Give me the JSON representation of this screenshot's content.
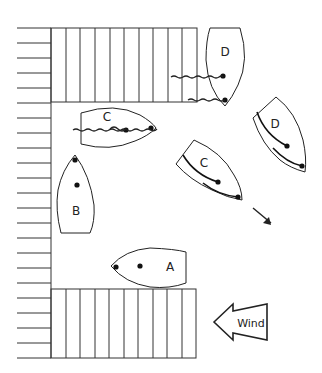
{
  "diagram": {
    "type": "boat-docking-maneuver",
    "boats": [
      {
        "id": "A",
        "label": "A",
        "position": "approaching lower dock, bow pointing left"
      },
      {
        "id": "B",
        "label": "B",
        "position": "alongside left wall, bow pointing up"
      },
      {
        "id": "C-moored",
        "label": "C",
        "position": "moored under upper dock with lines"
      },
      {
        "id": "C-moving",
        "label": "C",
        "position": "turning away, bow down-right"
      },
      {
        "id": "D-moored",
        "label": "D",
        "position": "moored at end of upper dock with two lines"
      },
      {
        "id": "D-moving",
        "label": "D",
        "position": "turning away, bow down-right"
      }
    ],
    "wind": {
      "label": "Wind",
      "direction": "right-to-left"
    },
    "motion_arrow": {
      "direction": "down-right"
    },
    "docks": [
      {
        "id": "upper-dock",
        "slats": 10
      },
      {
        "id": "lower-dock",
        "slats": 10
      },
      {
        "id": "left-wall",
        "ticks": 24
      }
    ],
    "colors": {
      "ink": "#222222",
      "background": "#ffffff"
    }
  }
}
